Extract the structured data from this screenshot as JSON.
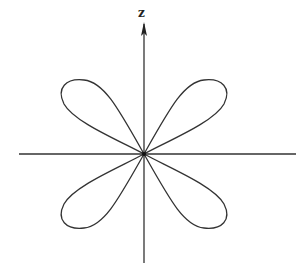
{
  "diagram": {
    "axis_labels": {
      "vertical": "z"
    },
    "center": [
      144,
      154
    ],
    "lobes": [
      "upper-left",
      "upper-right",
      "lower-left",
      "lower-right"
    ],
    "stroke_color": "#333333",
    "background_color": "#ffffff"
  }
}
